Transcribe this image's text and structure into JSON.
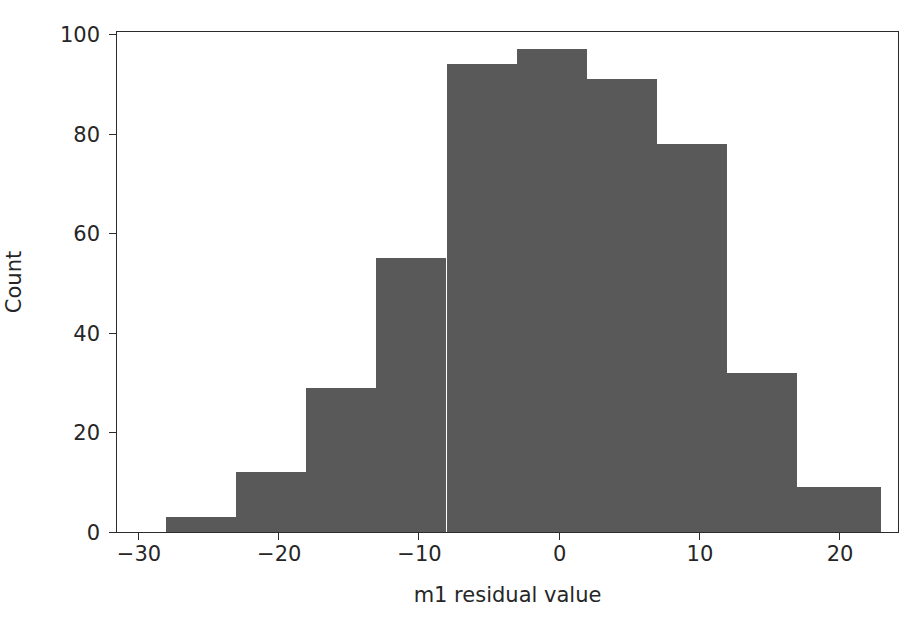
{
  "chart_data": {
    "type": "bar",
    "subtype": "histogram",
    "title": "",
    "xlabel": "m1 residual value",
    "ylabel": "Count",
    "xlim": [
      -31.5,
      24.2
    ],
    "ylim": [
      0,
      100.5
    ],
    "xticks": [
      -30,
      -20,
      -10,
      0,
      10,
      20
    ],
    "xticklabels": [
      "−30",
      "−20",
      "−10",
      "0",
      "10",
      "20"
    ],
    "yticks": [
      0,
      20,
      40,
      60,
      80,
      100
    ],
    "yticklabels": [
      "0",
      "20",
      "40",
      "60",
      "80",
      "100"
    ],
    "grid": false,
    "legend": null,
    "bar_color": "#595959",
    "axis_color": "#2b2b2b",
    "background": "#ffffff",
    "bin_edges": [
      -28,
      -23,
      -18,
      -13,
      -8,
      -3,
      2,
      7,
      12,
      17,
      23
    ],
    "bins": [
      {
        "x0": -28,
        "x1": -23,
        "count": 3
      },
      {
        "x0": -23,
        "x1": -18,
        "count": 12
      },
      {
        "x0": -18,
        "x1": -13,
        "count": 29
      },
      {
        "x0": -13,
        "x1": -8,
        "count": 55
      },
      {
        "x0": -8,
        "x1": -3,
        "count": 94
      },
      {
        "x0": -3,
        "x1": 2,
        "count": 97
      },
      {
        "x0": 2,
        "x1": 7,
        "count": 91
      },
      {
        "x0": 7,
        "x1": 12,
        "count": 78
      },
      {
        "x0": 12,
        "x1": 17,
        "count": 32
      },
      {
        "x0": 17,
        "x1": 23,
        "count": 9
      }
    ],
    "categories": [
      "-28 to -23",
      "-23 to -18",
      "-18 to -13",
      "-13 to -8",
      "-8 to -3",
      "-3 to 2",
      "2 to 7",
      "7 to 12",
      "12 to 17",
      "17 to 23"
    ],
    "values": [
      3,
      12,
      29,
      55,
      94,
      97,
      91,
      78,
      32,
      9
    ]
  }
}
